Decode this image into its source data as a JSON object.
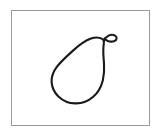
{
  "image": {
    "kind": "line-drawing",
    "subject": "pear",
    "title": "Pear outline drawing",
    "width": 162,
    "height": 138,
    "background_color": "#ffffff"
  },
  "frame": {
    "name": "picture-frame",
    "border_color": "#9a9a9a",
    "border_width": 1,
    "fill_color": "#ffffff",
    "left": 11,
    "top": 10,
    "width": 139,
    "height": 116
  },
  "drawing": {
    "stroke_color": "#1a1a1a",
    "stroke_width": 2.1,
    "fill_color": "none",
    "parts": [
      {
        "name": "pear-body",
        "label": "Pear body outline",
        "path": "M 104.0 40.2 C 101.0 37.6 96.0 36.8 91.0 38.6 C 85.0 40.8 79.0 45.2 73.0 50.6 C 67.0 56.0 61.0 61.4 57.0 66.6 C 53.2 71.6 51.4 76.6 51.6 81.6 C 51.8 87.2 54.2 92.4 58.4 96.4 C 62.8 100.6 68.8 103.2 75.2 103.4 C 81.8 103.6 88.2 101.2 93.2 96.8 C 98.0 92.6 101.2 86.8 102.8 80.4 C 104.2 74.8 104.4 69.0 104.0 63.4 C 103.6 57.8 103.0 52.4 103.4 47.6 C 103.6 44.8 104.0 42.4 104.0 40.2 Z"
      },
      {
        "name": "pear-stem",
        "label": "Pear stem hook",
        "path": "M 103.6 41.0 C 104.6 38.6 106.4 36.6 108.6 35.6 C 110.8 34.6 113.2 34.6 115.0 35.6 C 116.2 36.3 116.8 37.4 116.6 38.6 C 116.4 39.9 115.4 40.8 114.0 41.2 C 112.0 41.8 109.6 41.6 107.8 41.0 C 106.4 40.5 105.2 39.6 104.4 38.4"
      }
    ]
  }
}
